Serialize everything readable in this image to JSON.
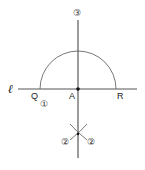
{
  "diagram": {
    "type": "geometric-construction",
    "labels": {
      "line": "ℓ",
      "point_q": "Q",
      "point_a": "A",
      "point_r": "R",
      "step1": "①",
      "step2_left": "②",
      "step2_right": "②",
      "step3": "③"
    },
    "colors": {
      "stroke": "#555555",
      "text": "#222222",
      "background": "#ffffff"
    }
  }
}
